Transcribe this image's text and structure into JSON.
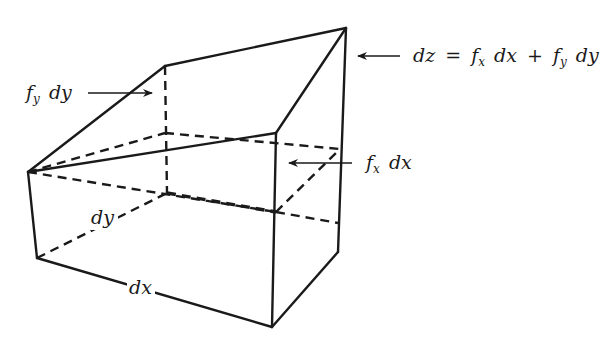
{
  "figure": {
    "labels": {
      "dz_lhs": "dz",
      "equals": "=",
      "f": "f",
      "sub_x": "x",
      "sub_y": "y",
      "dx": "dx",
      "dy": "dy",
      "plus": "+"
    },
    "annotations": [
      {
        "id": "total",
        "text": "dz = f_x dx + f_y dy",
        "arrow_direction": "left",
        "points_to": "right vertical edge at peak"
      },
      {
        "id": "fy_dy",
        "text": "f_y dy",
        "arrow_direction": "right",
        "points_to": "back-left vertical dashed edge"
      },
      {
        "id": "fx_dx",
        "text": "f_x dx",
        "arrow_direction": "left",
        "points_to": "front-right vertical edge above base"
      }
    ],
    "edge_labels": [
      {
        "id": "dx",
        "text": "dx",
        "edge": "bottom front edge"
      },
      {
        "id": "dy",
        "text": "dy",
        "edge": "bottom left depth edge (dashed)"
      }
    ],
    "colors": {
      "ink": "#1a1a1a",
      "background": "#ffffff"
    }
  }
}
